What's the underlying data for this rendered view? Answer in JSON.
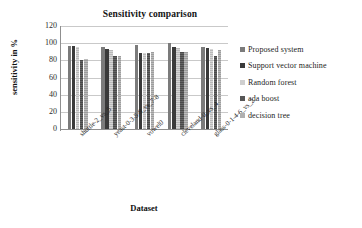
{
  "chart_data": {
    "type": "bar",
    "title": "Sensitivity comparison",
    "xlabel": "Dataset",
    "ylabel": "sensitivity in %",
    "ylim": [
      0,
      120
    ],
    "yticks": [
      0,
      20,
      40,
      60,
      80,
      100,
      120
    ],
    "grid": true,
    "legend_position": "right",
    "categories": [
      "shuttle-2_vs_5",
      "yeast-0-3-5-9_vs_7-8",
      "vowel0",
      "cleveland-0_vs_4",
      "glass-0-1-4-6_vs_2"
    ],
    "series": [
      {
        "name": "Proposed system",
        "color": "#7b7b7b",
        "values": [
          97,
          95,
          98,
          100,
          96
        ]
      },
      {
        "name": "Support vector machine",
        "color": "#3a3a3a",
        "values": [
          97,
          93,
          88,
          95,
          94
        ]
      },
      {
        "name": "Random forest",
        "color": "#cfcfcf",
        "values": [
          96,
          92,
          88,
          94,
          93
        ]
      },
      {
        "name": "ada boost",
        "color": "#565656",
        "values": [
          80,
          85,
          88,
          90,
          85
        ]
      },
      {
        "name": "decision tree",
        "color": "#b0b0b0",
        "values": [
          82,
          85,
          90,
          90,
          92
        ]
      }
    ]
  }
}
